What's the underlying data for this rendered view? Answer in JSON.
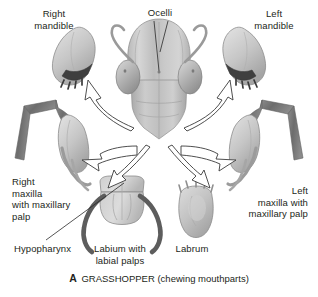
{
  "figure": {
    "organism": "grasshopper",
    "view": "anterior view of head with mouthparts dissected outward",
    "background_color": "#ffffff",
    "ink_color": "#231f20",
    "structure_fill": "#c9c9c9",
    "structure_dark": "#6f6f6f",
    "arrow_fill": "#ffffff",
    "arrow_stroke": "#3b3b3b"
  },
  "labels": [
    {
      "id": "right-mandible",
      "text": "Right\nmandible",
      "align": "center",
      "x": 25,
      "y": 8,
      "w": 58
    },
    {
      "id": "ocelli",
      "text": "Ocelli",
      "align": "center",
      "x": 137,
      "y": 7,
      "w": 46
    },
    {
      "id": "left-mandible",
      "text": "Left\nmandible",
      "align": "center",
      "x": 245,
      "y": 8,
      "w": 58
    },
    {
      "id": "right-maxilla",
      "text": "Right\nmaxilla\nwith maxillary\npalp",
      "align": "left",
      "x": 12,
      "y": 176,
      "w": 80
    },
    {
      "id": "left-maxilla",
      "text": "Left\nmaxilla with\nmaxillary palp",
      "align": "right",
      "x": 222,
      "y": 185,
      "w": 86
    },
    {
      "id": "hypopharynx",
      "text": "Hypopharynx",
      "align": "left",
      "x": 14,
      "y": 243,
      "w": 66
    },
    {
      "id": "labium",
      "text": "Labium with\nlabial palps",
      "align": "center",
      "x": 84,
      "y": 243,
      "w": 72
    },
    {
      "id": "labrum",
      "text": "Labrum",
      "align": "center",
      "x": 166,
      "y": 243,
      "w": 52
    }
  ],
  "caption": {
    "letter": "A",
    "title": "GRASSHOPPER",
    "parenthetical": "(chewing mouthparts)"
  },
  "parts": {
    "head_capsule": "head capsule",
    "compound_eye_left": "left compound eye",
    "compound_eye_right": "right compound eye",
    "antenna_left": "left antenna",
    "antenna_right": "right antenna",
    "ocellus_upper": "median ocellus",
    "ocellus_lower": "lateral ocellus",
    "mandible_right": "right mandible with teeth",
    "mandible_left": "left mandible with teeth",
    "maxilla_right": "right maxilla and maxillary palp",
    "maxilla_left": "left maxilla and maxillary palp",
    "labium": "labium with labial palps",
    "labrum": "labrum"
  },
  "arrows": [
    {
      "id": "arrow-right-mandible",
      "from": "mandible base (right)",
      "to": "right mandible"
    },
    {
      "id": "arrow-right-maxilla",
      "from": "maxilla base (right)",
      "to": "right maxilla"
    },
    {
      "id": "arrow-left-mandible",
      "from": "mandible base (left)",
      "to": "left mandible"
    },
    {
      "id": "arrow-left-maxilla",
      "from": "maxilla base (left)",
      "to": "left maxilla"
    },
    {
      "id": "arrow-labium",
      "from": "mouth region",
      "to": "labium"
    },
    {
      "id": "arrow-labrum",
      "from": "mouth region",
      "to": "labrum"
    }
  ],
  "leaders": [
    {
      "id": "leader-ocellus-upper",
      "label": "ocelli"
    },
    {
      "id": "leader-ocellus-lower",
      "label": "ocelli"
    },
    {
      "id": "leader-hypopharynx",
      "label": "hypopharynx"
    }
  ]
}
